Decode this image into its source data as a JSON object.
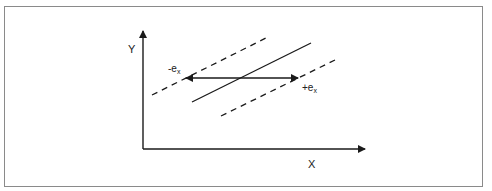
{
  "diagram": {
    "axis_labels": {
      "x": "X",
      "y": "Y"
    },
    "error_labels": {
      "minus": {
        "sign": "-",
        "base": "e",
        "subscript": "x"
      },
      "plus": {
        "sign": "+",
        "base": "e",
        "subscript": "x"
      }
    },
    "elements": {
      "regression_line": "solid",
      "upper_bound": "dashed",
      "lower_bound": "dashed",
      "error_arrow": "double-headed horizontal"
    },
    "colors": {
      "stroke": "#1a1a1a",
      "frame": "#8a8a8a",
      "background": "#ffffff"
    }
  }
}
